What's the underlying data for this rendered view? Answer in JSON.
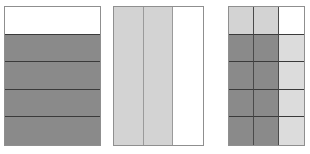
{
  "figure": {
    "background_color": "#ffffff",
    "palette": {
      "white": "#ffffff",
      "light_gray": "#d3d3d3",
      "light_gray_alt": "#dcdcdc",
      "dark_gray": "#8a8a8a",
      "outer_border": "#8f8f8f",
      "inner_divider_dark": "#3a3a3a",
      "inner_divider_medium": "#9a9a9a"
    }
  },
  "chart_data": {
    "type": "heatmap",
    "xlabel": "",
    "ylabel": "",
    "grid": true,
    "legend": "none",
    "blocks": [
      {
        "name": "block-one",
        "rows": 5,
        "columns": 1,
        "x": 4,
        "y": 6,
        "width": 97,
        "height": 140,
        "cells": [
          [
            "#ffffff"
          ],
          [
            "#8a8a8a"
          ],
          [
            "#8a8a8a"
          ],
          [
            "#8a8a8a"
          ],
          [
            "#8a8a8a"
          ]
        ],
        "values": [
          [
            0
          ],
          [
            1
          ],
          [
            1
          ],
          [
            1
          ],
          [
            1
          ]
        ]
      },
      {
        "name": "block-two",
        "rows": 1,
        "columns": 3,
        "x": 113,
        "y": 6,
        "width": 91,
        "height": 140,
        "cells": [
          [
            "#d3d3d3",
            "#d3d3d3",
            "#ffffff"
          ]
        ],
        "values": [
          [
            0.5,
            0.5,
            0
          ]
        ]
      },
      {
        "name": "block-three",
        "rows": 5,
        "columns": 3,
        "x": 228,
        "y": 6,
        "width": 77,
        "height": 140,
        "cells": [
          [
            "#d3d3d3",
            "#d3d3d3",
            "#ffffff"
          ],
          [
            "#8a8a8a",
            "#8a8a8a",
            "#dcdcdc"
          ],
          [
            "#8a8a8a",
            "#8a8a8a",
            "#dcdcdc"
          ],
          [
            "#8a8a8a",
            "#8a8a8a",
            "#dcdcdc"
          ],
          [
            "#8a8a8a",
            "#8a8a8a",
            "#dcdcdc"
          ]
        ],
        "values": [
          [
            0.5,
            0.5,
            0
          ],
          [
            1,
            1,
            0.4
          ],
          [
            1,
            1,
            0.4
          ],
          [
            1,
            1,
            0.4
          ],
          [
            1,
            1,
            0.4
          ]
        ]
      }
    ]
  }
}
